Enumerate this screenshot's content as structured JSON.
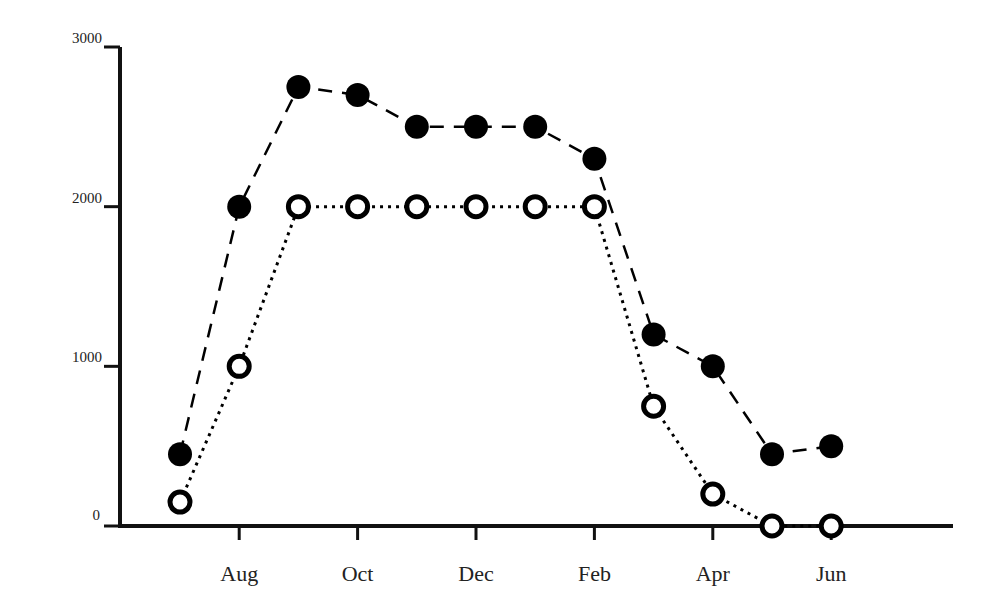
{
  "chart_data": {
    "type": "line",
    "title": "",
    "xlabel": "",
    "ylabel": "",
    "x": [
      "Jul",
      "Aug",
      "Sep",
      "Oct",
      "Nov",
      "Dec",
      "Jan",
      "Feb",
      "Mar",
      "Apr",
      "May",
      "Jun"
    ],
    "x_tick_labels": [
      "Aug",
      "Oct",
      "Dec",
      "Feb",
      "Apr",
      "Jun"
    ],
    "y_tick_labels": [
      "0",
      "1000",
      "2000",
      "3000"
    ],
    "ylim": [
      0,
      3000
    ],
    "grid": false,
    "legend": null,
    "series": [
      {
        "name": "Series A (filled markers, dashed line)",
        "marker": "filled-circle",
        "line_style": "dashed",
        "values": [
          450,
          2000,
          2750,
          2700,
          2500,
          2500,
          2500,
          2300,
          1200,
          1000,
          450,
          500
        ]
      },
      {
        "name": "Series B (open markers, dotted line)",
        "marker": "open-circle",
        "line_style": "dotted",
        "values": [
          150,
          1000,
          2000,
          2000,
          2000,
          2000,
          2000,
          2000,
          750,
          200,
          0,
          0
        ]
      }
    ]
  },
  "colors": {
    "axis": "#111111",
    "series_a": "#000000",
    "series_b": "#000000",
    "background": "#ffffff"
  }
}
